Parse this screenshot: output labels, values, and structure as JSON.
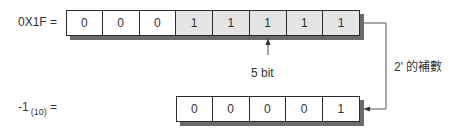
{
  "top": {
    "label": "0X1F =",
    "bits": [
      "0",
      "0",
      "0",
      "1",
      "1",
      "1",
      "1",
      "1"
    ],
    "highlighted": [
      false,
      false,
      false,
      true,
      true,
      true,
      true,
      true
    ]
  },
  "annotation": {
    "pointer_label": "5 bit",
    "conversion_label": "2' 的補數"
  },
  "bottom": {
    "label_main": "-1",
    "label_sub": "(10)",
    "label_eq": "=",
    "bits": [
      "0",
      "0",
      "0",
      "0",
      "1"
    ]
  },
  "colors": {
    "border": "#2a2a2a",
    "shadow": "#6b6b6b",
    "highlight_fill": "#e4e4e4",
    "line": "#555555"
  }
}
